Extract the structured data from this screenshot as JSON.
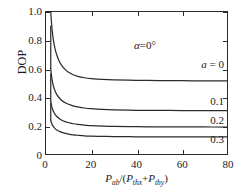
{
  "chart_data": {
    "type": "line",
    "title": "",
    "subtitle": "",
    "xlabel": "P_ab/(P_thx+P_thy)",
    "ylabel": "DOP",
    "xlim": [
      0,
      80
    ],
    "ylim": [
      0,
      1.0
    ],
    "grid": false,
    "legend_position": "inline-right",
    "x_ticks": [
      0,
      20,
      40,
      60,
      80
    ],
    "x_tick_labels": [
      "0",
      "20",
      "40",
      "60",
      "80"
    ],
    "y_ticks": [
      0,
      0.2,
      0.4,
      0.6,
      0.8,
      1.0
    ],
    "y_tick_labels": [
      "0",
      "0.2",
      "0.4",
      "0.6",
      "0.8",
      "1.0"
    ],
    "annotations": [
      {
        "name": "alpha-annotation",
        "text": "α=0°",
        "symbol": "α",
        "value": "0°",
        "x": 38,
        "y": 0.88
      }
    ],
    "series": [
      {
        "name": "a = 0",
        "label": "a = 0",
        "param": "a",
        "param_value": 0,
        "asymptote": 0.515,
        "x_start": 2.1,
        "color": "#2b2b2b",
        "label_x": 72,
        "label_y": 0.605,
        "points": [
          {
            "x": 2.1,
            "y": 1.0
          },
          {
            "x": 2.4,
            "y": 0.93
          },
          {
            "x": 2.8,
            "y": 0.86
          },
          {
            "x": 3.3,
            "y": 0.8
          },
          {
            "x": 4.0,
            "y": 0.74
          },
          {
            "x": 4.8,
            "y": 0.695
          },
          {
            "x": 5.8,
            "y": 0.655
          },
          {
            "x": 7.0,
            "y": 0.622
          },
          {
            "x": 8.5,
            "y": 0.594
          },
          {
            "x": 10.0,
            "y": 0.575
          },
          {
            "x": 12.0,
            "y": 0.558
          },
          {
            "x": 14.0,
            "y": 0.547
          },
          {
            "x": 17.0,
            "y": 0.537
          },
          {
            "x": 20.0,
            "y": 0.531
          },
          {
            "x": 25.0,
            "y": 0.525
          },
          {
            "x": 30.0,
            "y": 0.522
          },
          {
            "x": 40.0,
            "y": 0.519
          },
          {
            "x": 50.0,
            "y": 0.517
          },
          {
            "x": 60.0,
            "y": 0.516
          },
          {
            "x": 70.0,
            "y": 0.5155
          },
          {
            "x": 80.0,
            "y": 0.515
          }
        ]
      },
      {
        "name": "0.1",
        "label": "0.1",
        "param": "a",
        "param_value": 0.1,
        "asymptote": 0.305,
        "x_start": 2.1,
        "color": "#2b2b2b",
        "label_x": 72,
        "label_y": 0.375,
        "points": [
          {
            "x": 2.1,
            "y": 0.6
          },
          {
            "x": 2.4,
            "y": 0.555
          },
          {
            "x": 2.8,
            "y": 0.513
          },
          {
            "x": 3.3,
            "y": 0.477
          },
          {
            "x": 4.0,
            "y": 0.443
          },
          {
            "x": 4.8,
            "y": 0.418
          },
          {
            "x": 5.8,
            "y": 0.396
          },
          {
            "x": 7.0,
            "y": 0.377
          },
          {
            "x": 8.5,
            "y": 0.361
          },
          {
            "x": 10.0,
            "y": 0.35
          },
          {
            "x": 12.0,
            "y": 0.339
          },
          {
            "x": 14.0,
            "y": 0.332
          },
          {
            "x": 17.0,
            "y": 0.324
          },
          {
            "x": 20.0,
            "y": 0.319
          },
          {
            "x": 25.0,
            "y": 0.314
          },
          {
            "x": 30.0,
            "y": 0.311
          },
          {
            "x": 40.0,
            "y": 0.308
          },
          {
            "x": 50.0,
            "y": 0.307
          },
          {
            "x": 60.0,
            "y": 0.306
          },
          {
            "x": 70.0,
            "y": 0.3055
          },
          {
            "x": 80.0,
            "y": 0.305
          }
        ]
      },
      {
        "name": "0.2",
        "label": "0.2",
        "param": "a",
        "param_value": 0.2,
        "asymptote": 0.19,
        "x_start": 2.1,
        "color": "#2b2b2b",
        "label_x": 72,
        "label_y": 0.245,
        "points": [
          {
            "x": 2.1,
            "y": 0.372
          },
          {
            "x": 2.4,
            "y": 0.345
          },
          {
            "x": 2.8,
            "y": 0.32
          },
          {
            "x": 3.3,
            "y": 0.299
          },
          {
            "x": 4.0,
            "y": 0.279
          },
          {
            "x": 4.8,
            "y": 0.264
          },
          {
            "x": 5.8,
            "y": 0.25
          },
          {
            "x": 7.0,
            "y": 0.238
          },
          {
            "x": 8.5,
            "y": 0.228
          },
          {
            "x": 10.0,
            "y": 0.221
          },
          {
            "x": 12.0,
            "y": 0.213
          },
          {
            "x": 14.0,
            "y": 0.208
          },
          {
            "x": 17.0,
            "y": 0.203
          },
          {
            "x": 20.0,
            "y": 0.199
          },
          {
            "x": 25.0,
            "y": 0.196
          },
          {
            "x": 30.0,
            "y": 0.194
          },
          {
            "x": 40.0,
            "y": 0.192
          },
          {
            "x": 50.0,
            "y": 0.1912
          },
          {
            "x": 60.0,
            "y": 0.1906
          },
          {
            "x": 70.0,
            "y": 0.1902
          },
          {
            "x": 80.0,
            "y": 0.19
          }
        ]
      },
      {
        "name": "0.3",
        "label": "0.3",
        "param": "a",
        "param_value": 0.3,
        "asymptote": 0.12,
        "x_start": 2.1,
        "color": "#2b2b2b",
        "label_x": 72,
        "label_y": 0.068,
        "points": [
          {
            "x": 2.1,
            "y": 0.235
          },
          {
            "x": 2.4,
            "y": 0.22
          },
          {
            "x": 2.8,
            "y": 0.205
          },
          {
            "x": 3.3,
            "y": 0.192
          },
          {
            "x": 4.0,
            "y": 0.179
          },
          {
            "x": 4.8,
            "y": 0.169
          },
          {
            "x": 5.8,
            "y": 0.16
          },
          {
            "x": 7.0,
            "y": 0.152
          },
          {
            "x": 8.5,
            "y": 0.145
          },
          {
            "x": 10.0,
            "y": 0.14
          },
          {
            "x": 12.0,
            "y": 0.135
          },
          {
            "x": 14.0,
            "y": 0.132
          },
          {
            "x": 17.0,
            "y": 0.128
          },
          {
            "x": 20.0,
            "y": 0.126
          },
          {
            "x": 25.0,
            "y": 0.124
          },
          {
            "x": 30.0,
            "y": 0.1227
          },
          {
            "x": 40.0,
            "y": 0.1213
          },
          {
            "x": 50.0,
            "y": 0.1207
          },
          {
            "x": 60.0,
            "y": 0.1203
          },
          {
            "x": 70.0,
            "y": 0.1201
          },
          {
            "x": 80.0,
            "y": 0.12
          }
        ]
      }
    ],
    "axis_titles": {
      "y": "DOP",
      "x_numerator_symbol": "P",
      "x_numerator_sub": "ab",
      "x_denom_first_symbol": "P",
      "x_denom_first_sub": "thx",
      "x_denom_second_symbol": "P",
      "x_denom_second_sub": "thy",
      "x_plus": "+",
      "x_slash": "/(",
      "x_close": ")"
    },
    "colors": {
      "curve": "#2b2b2b",
      "axis": "#2b2b2b",
      "text": "#1a1a1a",
      "background": "#ffffff"
    }
  }
}
